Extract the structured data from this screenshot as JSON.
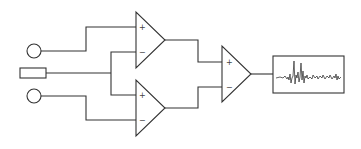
{
  "diagram": {
    "type": "differential-amplifier-circuit",
    "colors": {
      "stroke": "#333333",
      "background": "#ffffff"
    },
    "inputs": [
      {
        "id": "electrode-1",
        "shape": "circle",
        "cx": 34,
        "cy": 51,
        "r": 7
      },
      {
        "id": "reference-electrode",
        "shape": "rectangle",
        "x": 20,
        "y": 68,
        "w": 26,
        "h": 10
      },
      {
        "id": "electrode-2",
        "shape": "circle",
        "cx": 34,
        "cy": 96,
        "r": 7
      }
    ],
    "amplifiers": [
      {
        "id": "amp-1",
        "left": 136,
        "top": 12,
        "bottom": 68,
        "tip_x": 165,
        "plus_label": "+",
        "minus_label": "−"
      },
      {
        "id": "amp-2",
        "left": 136,
        "top": 80,
        "bottom": 136,
        "tip_x": 165,
        "plus_label": "+",
        "minus_label": "−"
      },
      {
        "id": "amp-3",
        "left": 222,
        "top": 46,
        "bottom": 102,
        "tip_x": 251,
        "plus_label": "+",
        "minus_label": "−"
      }
    ],
    "output": {
      "id": "signal-display",
      "x": 273,
      "y": 56,
      "w": 71,
      "h": 37,
      "content": "noisy signal trace with spikes"
    }
  }
}
